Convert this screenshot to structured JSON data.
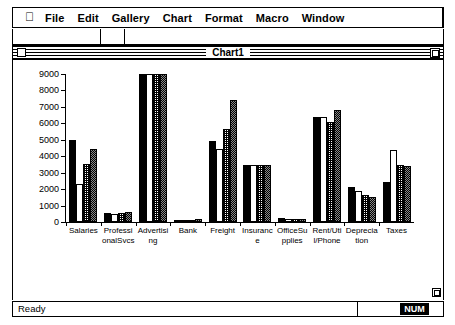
{
  "menubar": {
    "apple_icon": "apple-icon",
    "items": [
      {
        "label": "File"
      },
      {
        "label": "Edit"
      },
      {
        "label": "Gallery"
      },
      {
        "label": "Chart"
      },
      {
        "label": "Format"
      },
      {
        "label": "Macro"
      },
      {
        "label": "Window"
      }
    ]
  },
  "window": {
    "title": "Chart1",
    "close_box": "close-box",
    "zoom_box": "zoom-box",
    "resize_grip": "resize-grip"
  },
  "statusbar": {
    "message": "Ready",
    "num_lock": "NUM"
  },
  "chart_data": {
    "type": "bar",
    "title": "",
    "xlabel": "",
    "ylabel": "",
    "ylim": [
      0,
      9000
    ],
    "yticks": [
      0,
      1000,
      2000,
      3000,
      4000,
      5000,
      6000,
      7000,
      8000,
      9000
    ],
    "grid": false,
    "legend": "none",
    "categories": [
      "Salaries",
      "Professional Svcs",
      "Advertising",
      "Bank",
      "Freight",
      "Insurance",
      "Office Supplies",
      "Rent/Util/Phone",
      "Depreciation",
      "Taxes"
    ],
    "category_labels_wrapped": [
      "Salarie s",
      "Profess ional Svcs",
      "Adverti sing",
      "Bank",
      "Freight",
      "Insuran ce",
      "Office Supplie s",
      "Rent/U til/Pho ne",
      "Depreci ation",
      "Taxes"
    ],
    "series": [
      {
        "name": "Series 1",
        "pattern": "solid-black",
        "values": [
          5000,
          550,
          9000,
          150,
          4950,
          3450,
          220,
          6400,
          2150,
          2450
        ]
      },
      {
        "name": "Series 2",
        "pattern": "white",
        "values": [
          2300,
          500,
          9000,
          100,
          4450,
          3450,
          200,
          6400,
          1900,
          4400
        ]
      },
      {
        "name": "Series 3",
        "pattern": "gray-dither",
        "values": [
          3500,
          570,
          9000,
          120,
          5650,
          3450,
          180,
          6100,
          1650,
          3450
        ]
      },
      {
        "name": "Series 4",
        "pattern": "dark-dither",
        "values": [
          4450,
          600,
          9000,
          200,
          7400,
          3450,
          190,
          6800,
          1550,
          3400
        ]
      }
    ]
  }
}
